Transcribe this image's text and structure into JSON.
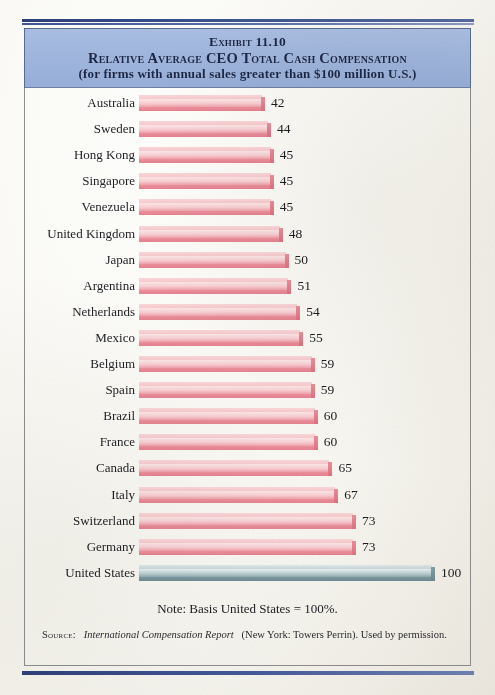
{
  "header": {
    "exhibit_label": "Exhibit 11.10",
    "title": "Relative Average CEO Total Cash Compensation",
    "subtitle": "(for firms with annual sales greater than $100 million U.S.)",
    "band_color": "#9fb5dc"
  },
  "footer": {
    "note": "Note: Basis United States = 100%.",
    "source_label": "Source:",
    "source_title": "International Compensation Report",
    "source_rest": "(New York: Towers Perrin). Used by permission."
  },
  "colors": {
    "bar_pink": "#f0a9b2",
    "bar_pink_base": "#e4818f",
    "bar_steel": "#a8c0c6",
    "bar_steel_base": "#6e8a93",
    "rule_navy": "#2e4079",
    "text": "#1c1c22",
    "page": "#f7f6f1"
  },
  "chart_data": {
    "type": "bar",
    "orientation": "horizontal",
    "title": "Relative Average CEO Total Cash Compensation",
    "subtitle": "(for firms with annual sales greater than $100 million U.S.)",
    "xlabel": "",
    "ylabel": "",
    "xlim": [
      0,
      100
    ],
    "grid": false,
    "legend": "none",
    "note": "Note: Basis United States = 100%.",
    "categories": [
      "Australia",
      "Sweden",
      "Hong Kong",
      "Singapore",
      "Venezuela",
      "United Kingdom",
      "Japan",
      "Argentina",
      "Netherlands",
      "Mexico",
      "Belgium",
      "Spain",
      "Brazil",
      "France",
      "Canada",
      "Italy",
      "Switzerland",
      "Germany",
      "United States"
    ],
    "values": [
      42,
      44,
      45,
      45,
      45,
      48,
      50,
      51,
      54,
      55,
      59,
      59,
      60,
      60,
      65,
      67,
      73,
      73,
      100
    ],
    "bars": [
      {
        "label": "Australia",
        "value": 42,
        "value_text": "42",
        "color": "pink"
      },
      {
        "label": "Sweden",
        "value": 44,
        "value_text": "44",
        "color": "pink"
      },
      {
        "label": "Hong Kong",
        "value": 45,
        "value_text": "45",
        "color": "pink"
      },
      {
        "label": "Singapore",
        "value": 45,
        "value_text": "45",
        "color": "pink"
      },
      {
        "label": "Venezuela",
        "value": 45,
        "value_text": "45",
        "color": "pink"
      },
      {
        "label": "United Kingdom",
        "value": 48,
        "value_text": "48",
        "color": "pink"
      },
      {
        "label": "Japan",
        "value": 50,
        "value_text": "50",
        "color": "pink"
      },
      {
        "label": "Argentina",
        "value": 51,
        "value_text": "51",
        "color": "pink"
      },
      {
        "label": "Netherlands",
        "value": 54,
        "value_text": "54",
        "color": "pink"
      },
      {
        "label": "Mexico",
        "value": 55,
        "value_text": "55",
        "color": "pink"
      },
      {
        "label": "Belgium",
        "value": 59,
        "value_text": "59",
        "color": "pink"
      },
      {
        "label": "Spain",
        "value": 59,
        "value_text": "59",
        "color": "pink"
      },
      {
        "label": "Brazil",
        "value": 60,
        "value_text": "60",
        "color": "pink"
      },
      {
        "label": "France",
        "value": 60,
        "value_text": "60",
        "color": "pink"
      },
      {
        "label": "Canada",
        "value": 65,
        "value_text": "65",
        "color": "pink"
      },
      {
        "label": "Italy",
        "value": 67,
        "value_text": "67",
        "color": "pink"
      },
      {
        "label": "Switzerland",
        "value": 73,
        "value_text": "73",
        "color": "pink"
      },
      {
        "label": "Germany",
        "value": 73,
        "value_text": "73",
        "color": "pink"
      },
      {
        "label": "United States",
        "value": 100,
        "value_text": "100",
        "color": "steel"
      }
    ]
  }
}
